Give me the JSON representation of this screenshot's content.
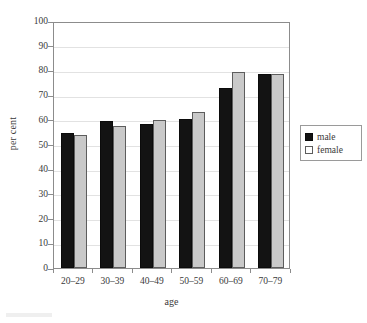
{
  "chart_data": {
    "type": "bar",
    "title": "",
    "xlabel": "age",
    "ylabel": "per cent",
    "categories": [
      "20–29",
      "30–39",
      "40–49",
      "50–59",
      "60–69",
      "70–79"
    ],
    "series": [
      {
        "name": "male",
        "color": "#131313",
        "values": [
          54.5,
          59.5,
          58.5,
          60.5,
          73.0,
          78.5
        ]
      },
      {
        "name": "female",
        "color": "#c9c9c9",
        "values": [
          54.0,
          57.5,
          60.0,
          63.0,
          79.5,
          78.5
        ]
      }
    ],
    "ylim": [
      0,
      100
    ],
    "ytick_values": [
      0,
      10,
      20,
      30,
      40,
      50,
      60,
      70,
      80,
      90,
      100
    ],
    "ytick_labels": [
      "0",
      "10",
      "20",
      "30",
      "40",
      "50",
      "60",
      "70",
      "80",
      "90",
      "100"
    ],
    "grid": true,
    "grid_axis": "y",
    "legend_position": "right",
    "legend_entries": [
      "male",
      "female"
    ],
    "bar_group_count": 6,
    "bars_per_group": 2
  },
  "colors": {
    "male_bar": "#131313",
    "female_bar": "#c9c9c9",
    "female_bar_outline": "#5d5d5d",
    "gridline": "#e2e2e2",
    "axis": "#8c8c8c",
    "text": "#3a3a3a",
    "background": "#ffffff"
  }
}
